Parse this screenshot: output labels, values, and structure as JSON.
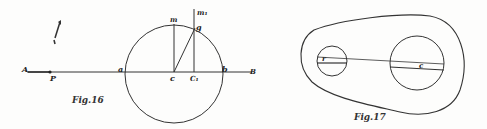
{
  "figures": [
    {
      "caption": "Fig.16",
      "labels": {
        "A": "A",
        "P": "P",
        "a": "a",
        "c": "c",
        "C1": "C₁",
        "b": "b",
        "B": "B",
        "m": "m",
        "m1": "m₁",
        "g": "g"
      }
    },
    {
      "caption": "Fig.17",
      "labels": {
        "r": "r",
        "c": "c"
      }
    }
  ]
}
